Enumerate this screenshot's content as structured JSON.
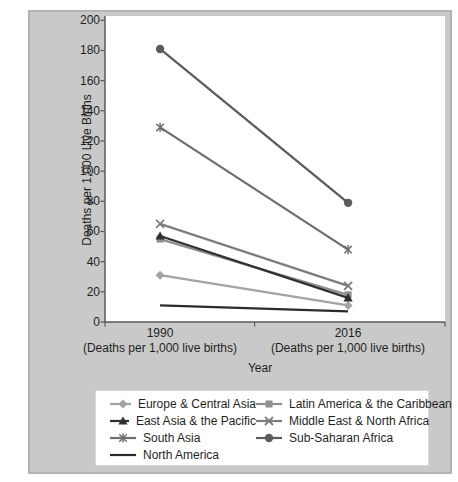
{
  "figure": {
    "background_color": "#c9c9c9",
    "plot_background_color": "#ffffff",
    "axis_color": "#595959",
    "text_color": "#1f1f1f"
  },
  "chart_data": {
    "type": "line",
    "title": "",
    "xlabel": "Year",
    "ylabel": "Deaths per 1,000 Live Births",
    "categories": [
      "1990",
      "2016"
    ],
    "category_sublabels": [
      "(Deaths per 1,000 live births)",
      "(Deaths per 1,000 live births)"
    ],
    "ylim": [
      0,
      200
    ],
    "ytick_step": 20,
    "ytick_labels": [
      "0",
      "20",
      "40",
      "60",
      "80",
      "100",
      "120",
      "140",
      "160",
      "180",
      "200"
    ],
    "grid": false,
    "legend_position": "bottom",
    "series": [
      {
        "name": "Europe & Central Asia",
        "marker": "diamond",
        "color": "#a3a3a3",
        "values": [
          31,
          11
        ]
      },
      {
        "name": "Latin America & the Caribbean",
        "marker": "square",
        "color": "#8f8f8f",
        "values": [
          55,
          18
        ]
      },
      {
        "name": "East Asia & the Pacific",
        "marker": "triangle",
        "color": "#303030",
        "values": [
          57,
          16
        ]
      },
      {
        "name": "Middle East & North Africa",
        "marker": "x",
        "color": "#7d7d7d",
        "values": [
          65,
          24
        ]
      },
      {
        "name": "South Asia",
        "marker": "asterisk",
        "color": "#6e6e6e",
        "values": [
          129,
          48
        ]
      },
      {
        "name": "Sub-Saharan Africa",
        "marker": "circle",
        "color": "#5c5c5c",
        "values": [
          181,
          79
        ]
      },
      {
        "name": "North America",
        "marker": "none",
        "color": "#2b2b2b",
        "values": [
          11,
          7
        ]
      }
    ]
  }
}
